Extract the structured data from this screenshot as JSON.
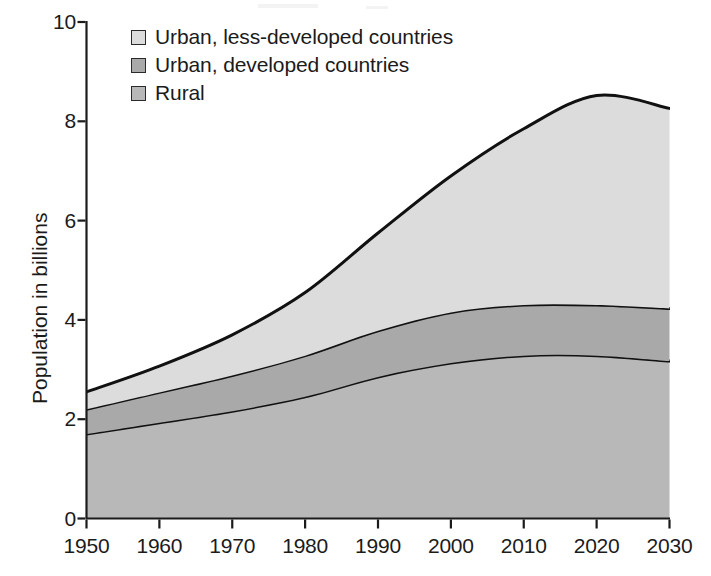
{
  "chart_data": {
    "type": "area",
    "title": "",
    "subtitle": "",
    "xlabel": "",
    "ylabel": "Population in billions",
    "xlim": [
      1950,
      2030
    ],
    "ylim": [
      0,
      10
    ],
    "stacked": true,
    "grid": false,
    "legend_position": "top-left",
    "x": [
      1950,
      1960,
      1970,
      1980,
      1990,
      2000,
      2010,
      2020,
      2030
    ],
    "x_tick_labels": [
      "1950",
      "1960",
      "1970",
      "1980",
      "1990",
      "2000",
      "2010",
      "2020",
      "2030"
    ],
    "y_ticks": [
      0,
      2,
      4,
      6,
      8,
      10
    ],
    "y_tick_labels": [
      "0",
      "2",
      "4",
      "6",
      "8",
      "10"
    ],
    "series": [
      {
        "name": "Rural",
        "color": "#b8b8b8",
        "values": [
          1.7,
          1.93,
          2.16,
          2.45,
          2.85,
          3.13,
          3.28,
          3.28,
          3.17
        ]
      },
      {
        "name": "Urban, developed countries",
        "color": "#a9a9a9",
        "values": [
          0.5,
          0.61,
          0.72,
          0.83,
          0.93,
          1.02,
          1.02,
          1.02,
          1.06
        ]
      },
      {
        "name": "Urban, less-developed countries",
        "color": "#dcdcdc",
        "values": [
          0.35,
          0.53,
          0.82,
          1.27,
          1.97,
          2.75,
          3.55,
          4.22,
          4.03
        ]
      }
    ],
    "cumulative_tops": {
      "rural": [
        1.7,
        1.93,
        2.16,
        2.45,
        2.85,
        3.13,
        3.28,
        3.28,
        3.17
      ],
      "urban_developed": [
        2.2,
        2.54,
        2.88,
        3.28,
        3.78,
        4.15,
        4.3,
        4.3,
        4.23
      ],
      "total": [
        2.55,
        3.07,
        3.7,
        4.55,
        5.75,
        6.9,
        7.85,
        8.52,
        8.26
      ]
    }
  },
  "legend": {
    "items": [
      {
        "label": "Urban, less-developed countries",
        "color": "#dcdcdc"
      },
      {
        "label": "Urban, developed countries",
        "color": "#a9a9a9"
      },
      {
        "label": "Rural",
        "color": "#b8b8b8"
      }
    ]
  },
  "axes": {
    "y_title": "Population in billions",
    "y_labels": [
      "10",
      "8",
      "6",
      "4",
      "2",
      "0"
    ],
    "x_labels": [
      "1950",
      "1960",
      "1970",
      "1980",
      "1990",
      "2000",
      "2010",
      "2020",
      "2030"
    ]
  },
  "colors": {
    "axis": "#1b1b1b",
    "curve": "#111111",
    "background": "#ffffff"
  }
}
